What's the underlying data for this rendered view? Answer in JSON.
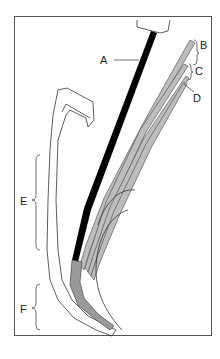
{
  "figure": {
    "labels": {
      "A": "A",
      "B": "B",
      "C": "C",
      "D": "D",
      "E": "E",
      "F": "F"
    },
    "colors": {
      "stroke": "#333333",
      "rod": "#000000",
      "strand_fill": "#bdbdbd",
      "frame": "#555555"
    }
  }
}
